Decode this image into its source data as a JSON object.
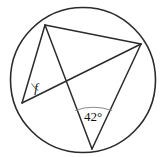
{
  "figure": {
    "kind": "circle-geometry-diagram",
    "background_color": "#ffffff",
    "stroke_color": "#2b2b2b",
    "arc_color": "#8d8d8d",
    "circle": {
      "cx": 83,
      "cy": 80,
      "r": 72.5
    },
    "points": [
      {
        "id": "A",
        "name": "vertex-top-left",
        "x": 45,
        "y": 25
      },
      {
        "id": "B",
        "name": "vertex-left",
        "x": 22,
        "y": 103
      },
      {
        "id": "C",
        "name": "vertex-right",
        "x": 141,
        "y": 44
      },
      {
        "id": "D",
        "name": "vertex-bottom",
        "x": 92,
        "y": 149
      }
    ],
    "chords": [
      {
        "id": "AB",
        "name": "chord-top-left-to-left",
        "x1": 45,
        "y1": 25,
        "x2": 22,
        "y2": 103
      },
      {
        "id": "AC",
        "name": "chord-top-left-to-right",
        "x1": 45,
        "y1": 25,
        "x2": 141,
        "y2": 44
      },
      {
        "id": "AD",
        "name": "chord-top-left-to-bottom",
        "x1": 45,
        "y1": 25,
        "x2": 92,
        "y2": 149
      },
      {
        "id": "BC",
        "name": "chord-left-to-right",
        "x1": 22,
        "y1": 103,
        "x2": 141,
        "y2": 44
      },
      {
        "id": "CD",
        "name": "chord-right-to-bottom",
        "x1": 141,
        "y1": 44,
        "x2": 92,
        "y2": 149
      }
    ],
    "angles": [
      {
        "id": "f",
        "name": "angle-f-at-left-vertex",
        "label": "f",
        "italic": true,
        "vertex": "B",
        "label_x": 36,
        "label_y": 89,
        "arc_path": "M 38.5 90.5 A 19 19 0 0 1 31.5 83.5",
        "subtends": "arc AC",
        "known": false
      },
      {
        "id": "d42",
        "name": "angle-42-at-bottom-vertex",
        "label": "42°",
        "italic": false,
        "vertex": "D",
        "label_x": 93,
        "label_y": 118,
        "arc_path": "M 75 110.5 Q 93 104 112 110.5",
        "subtends": "arc AC",
        "known": true
      }
    ]
  }
}
